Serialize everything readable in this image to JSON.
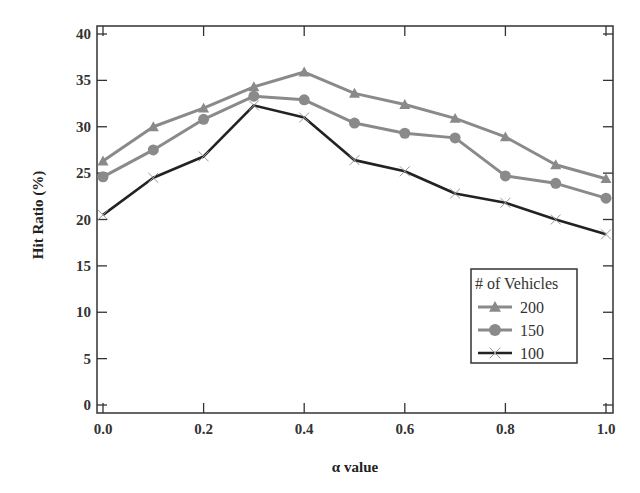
{
  "chart_data": {
    "type": "line",
    "title": "",
    "xlabel": "α value",
    "ylabel": "Hit Ratio (%)",
    "x": [
      0.0,
      0.1,
      0.2,
      0.3,
      0.4,
      0.5,
      0.6,
      0.7,
      0.8,
      0.9,
      1.0
    ],
    "xlim": [
      0.0,
      1.0
    ],
    "ylim": [
      0,
      40
    ],
    "xticks": [
      "0.0",
      "0.2",
      "0.4",
      "0.6",
      "0.8",
      "1.0"
    ],
    "yticks": [
      "0",
      "5",
      "10",
      "15",
      "20",
      "25",
      "30",
      "35",
      "40"
    ],
    "grid": false,
    "legend": {
      "title": "# of Vehicles",
      "position": "lower right",
      "entries": [
        "200",
        "150",
        "100"
      ]
    },
    "series": [
      {
        "name": "200",
        "marker": "triangle",
        "color": "#8a8a8a",
        "values": [
          26.3,
          30.0,
          32.0,
          34.3,
          35.9,
          33.6,
          32.4,
          30.9,
          28.9,
          25.9,
          24.4
        ]
      },
      {
        "name": "150",
        "marker": "circle",
        "color": "#8a8a8a",
        "values": [
          24.6,
          27.5,
          30.8,
          33.3,
          32.9,
          30.4,
          29.3,
          28.8,
          24.7,
          23.9,
          22.3
        ]
      },
      {
        "name": "100",
        "marker": "x",
        "color": "#222222",
        "values": [
          20.5,
          24.5,
          26.8,
          32.3,
          31.0,
          26.4,
          25.2,
          22.8,
          21.8,
          20.0,
          18.4
        ]
      }
    ]
  }
}
